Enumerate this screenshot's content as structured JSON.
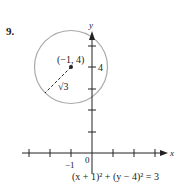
{
  "problem": {
    "number": "9."
  },
  "axes": {
    "x_label": "x",
    "y_label": "y",
    "origin_label": "0",
    "x_tick_label": "−1",
    "y_tick_label": "4",
    "x_ticks": [
      -3,
      -2,
      -1,
      0,
      1,
      2,
      3
    ],
    "y_ticks": [
      1,
      2,
      3,
      4,
      5
    ]
  },
  "circle": {
    "center_label": "(−1, 4)",
    "center": [
      -1,
      4
    ],
    "radius_label": "√3",
    "radius": 1.732,
    "stroke_color": "#a9a9a9"
  },
  "equation": {
    "text": "(x + 1)² + (y − 4)² = 3"
  }
}
